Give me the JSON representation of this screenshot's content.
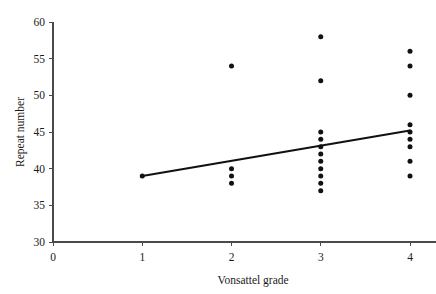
{
  "chart_data": {
    "type": "scatter",
    "title": "",
    "subtitle": "",
    "xlabel": "Vonsattel grade",
    "ylabel": "Repeat number",
    "xlim": [
      0,
      4.35
    ],
    "ylim": [
      30,
      60
    ],
    "xticks": [
      0,
      1,
      2,
      3,
      4
    ],
    "xtick_labels": [
      "0",
      "1",
      "2",
      "3",
      "4"
    ],
    "yticks": [
      30,
      35,
      40,
      45,
      50,
      55,
      60
    ],
    "ytick_labels": [
      "30",
      "35",
      "40",
      "45",
      "50",
      "55",
      "60"
    ],
    "grid": false,
    "legend": null,
    "marker": "filled-circle",
    "marker_color": "#111111",
    "points": [
      {
        "x": 1,
        "y": 39
      },
      {
        "x": 2,
        "y": 54
      },
      {
        "x": 2,
        "y": 40
      },
      {
        "x": 2,
        "y": 39
      },
      {
        "x": 2,
        "y": 38
      },
      {
        "x": 3,
        "y": 58
      },
      {
        "x": 3,
        "y": 52
      },
      {
        "x": 3,
        "y": 45
      },
      {
        "x": 3,
        "y": 44
      },
      {
        "x": 3,
        "y": 43
      },
      {
        "x": 3,
        "y": 42
      },
      {
        "x": 3,
        "y": 41
      },
      {
        "x": 3,
        "y": 40
      },
      {
        "x": 3,
        "y": 39
      },
      {
        "x": 3,
        "y": 38
      },
      {
        "x": 3,
        "y": 37
      },
      {
        "x": 4,
        "y": 56
      },
      {
        "x": 4,
        "y": 54
      },
      {
        "x": 4,
        "y": 50
      },
      {
        "x": 4,
        "y": 46
      },
      {
        "x": 4,
        "y": 45
      },
      {
        "x": 4,
        "y": 44
      },
      {
        "x": 4,
        "y": 43
      },
      {
        "x": 4,
        "y": 41
      },
      {
        "x": 4,
        "y": 39
      }
    ],
    "trend_line": {
      "type": "linear-fit",
      "color": "#111111",
      "x_start": 1,
      "y_start": 39,
      "x_end": 4,
      "y_end": 45.2
    }
  }
}
